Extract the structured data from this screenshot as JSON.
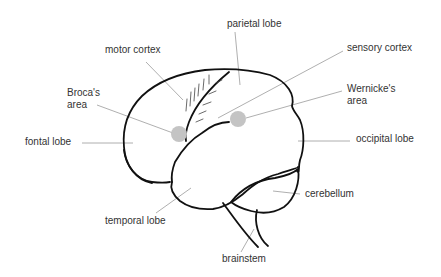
{
  "diagram": {
    "colors": {
      "outline": "#111111",
      "leader_line": "#9a9a9a",
      "area_marker": "#c4c4c4",
      "label_text": "#333333",
      "background": "#ffffff"
    },
    "labels": {
      "parietal_lobe": "parietal lobe",
      "motor_cortex": "motor cortex",
      "sensory_cortex": "sensory cortex",
      "brocas_area_line1": "Broca's",
      "brocas_area_line2": "area",
      "wernickes_area_line1": "Wernicke's",
      "wernickes_area_line2": "area",
      "frontal_lobe": "fontal lobe",
      "occipital_lobe": "occipital lobe",
      "cerebellum": "cerebellum",
      "temporal_lobe": "temporal lobe",
      "brainstem": "brainstem"
    },
    "markers": [
      {
        "name": "brocas-area-marker",
        "cx": 179,
        "cy": 134,
        "r": 8
      },
      {
        "name": "wernickes-area-marker",
        "cx": 238,
        "cy": 119,
        "r": 8
      }
    ]
  }
}
